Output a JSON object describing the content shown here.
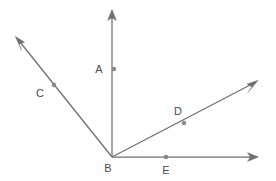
{
  "figure": {
    "canvas": {
      "width": 276,
      "height": 181
    },
    "background_color": "#ffffff",
    "line_color": "#6f6f6f",
    "label_color": "#4a4a4a",
    "dot_color": "#8a8a8a"
  },
  "vertex": {
    "name": "B",
    "label": "B",
    "x": 112,
    "y": 157,
    "label_x": 108,
    "label_y": 172
  },
  "rays": [
    {
      "id": "ray-bc",
      "label": "C",
      "from": "B",
      "direction": "upper-left",
      "tip_x": 16,
      "tip_y": 37,
      "angle_deg": 128.7,
      "point": {
        "label": "C",
        "dot_x": 54,
        "dot_y": 85,
        "label_x": 40,
        "label_y": 97
      }
    },
    {
      "id": "ray-ba",
      "label": "A",
      "from": "B",
      "direction": "up",
      "tip_x": 112,
      "tip_y": 10,
      "angle_deg": 90,
      "point": {
        "label": "A",
        "dot_x": 114,
        "dot_y": 69,
        "label_x": 99,
        "label_y": 73
      }
    },
    {
      "id": "ray-bd",
      "label": "D",
      "from": "B",
      "direction": "upper-right",
      "tip_x": 257,
      "tip_y": 81,
      "angle_deg": 27.7,
      "point": {
        "label": "D",
        "dot_x": 184,
        "dot_y": 123,
        "label_x": 178,
        "label_y": 115
      }
    },
    {
      "id": "ray-be",
      "label": "E",
      "from": "B",
      "direction": "right",
      "tip_x": 258,
      "tip_y": 157,
      "angle_deg": 0,
      "point": {
        "label": "E",
        "dot_x": 166,
        "dot_y": 157,
        "label_x": 166,
        "label_y": 174
      }
    }
  ],
  "labels": {
    "a": "A",
    "b": "B",
    "c": "C",
    "d": "D",
    "e": "E"
  }
}
